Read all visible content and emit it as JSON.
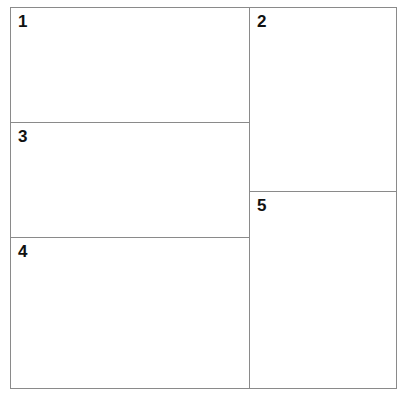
{
  "diagram": {
    "line_color": "#8a8a8a",
    "panels": [
      {
        "id": "1",
        "label": "1"
      },
      {
        "id": "2",
        "label": "2"
      },
      {
        "id": "3",
        "label": "3"
      },
      {
        "id": "4",
        "label": "4"
      },
      {
        "id": "5",
        "label": "5"
      }
    ]
  }
}
